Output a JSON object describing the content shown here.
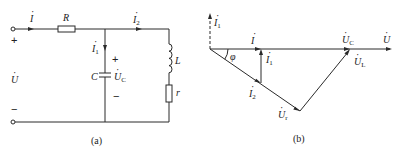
{
  "figure_a": {
    "caption": "(a)",
    "source": {
      "voltage_label": "U",
      "voltage_dot": "·",
      "plus_sign": "+",
      "minus_sign": "−"
    },
    "current_total": {
      "label": "I",
      "dot": "·"
    },
    "resistor_series": {
      "label": "R"
    },
    "branch_capacitor": {
      "current_label": "I",
      "current_sub": "1",
      "capacitor_label": "C",
      "voltage_label": "U",
      "voltage_sub": "C",
      "plus_sign": "+",
      "minus_sign": "−"
    },
    "branch_inductive": {
      "current_label": "I",
      "current_sub": "2",
      "inductor_label": "L",
      "resistor_label": "r"
    }
  },
  "figure_b": {
    "caption": "(b)",
    "phasors": {
      "I1_vertical": {
        "label": "I",
        "sub": "1"
      },
      "I_total": {
        "label": "I"
      },
      "I1_inline": {
        "label": "I",
        "sub": "1"
      },
      "I2": {
        "label": "I",
        "sub": "2"
      },
      "Ur": {
        "label": "U",
        "sub": "r"
      },
      "UL": {
        "label": "U",
        "sub": "L"
      },
      "UC": {
        "label": "U",
        "sub": "C"
      },
      "U": {
        "label": "U"
      }
    },
    "angle_label": "φ",
    "dot": "·"
  }
}
